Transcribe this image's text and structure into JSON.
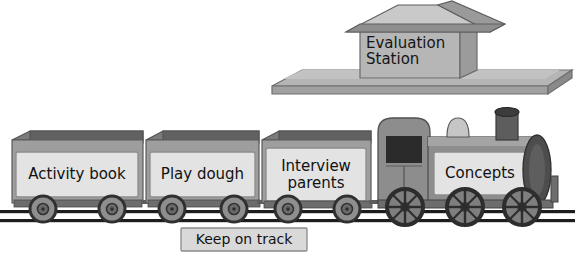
{
  "diagram": {
    "background": "#ffffff"
  },
  "station": {
    "name": "evaluation-station",
    "label": "Evaluation\nStation",
    "roof_light": "#c8c8c8",
    "roof_dark": "#8f8f8f",
    "wall": "#b5b5b5",
    "wall_side": "#9a9a9a",
    "platform_top": "#b0b0b0",
    "platform_edge": "#7d7d7d"
  },
  "locomotive": {
    "name": "locomotive",
    "label": "Concepts",
    "body": "#8d8d8d",
    "body_dark": "#6f6f6f",
    "panel": "#dedede",
    "window": "#2b2b2b",
    "chimney": "#5a5a5a",
    "chimney_cap": "#3c3c3c",
    "dome": "#c4c4c4",
    "smokebox": "#4a4a4a",
    "wheel": "#6a6a6a",
    "wheel_rim": "#2f2f2f",
    "wheel_count": 3
  },
  "wagons": [
    {
      "name": "wagon-activity-book",
      "label": "Activity book",
      "x": 10,
      "width": 130,
      "wheels": 2
    },
    {
      "name": "wagon-play-dough",
      "label": "Play dough",
      "x": 140,
      "width": 118,
      "wheels": 2
    },
    {
      "name": "wagon-interview-parents",
      "label": "Interview\nparents",
      "x": 258,
      "width": 112,
      "wheels": 2
    }
  ],
  "wagon_style": {
    "rim": "#7b7b7b",
    "inner": "#5f5f5f",
    "body": "#9d9d9d",
    "panel": "#e2e2e2",
    "panel_border": "#8a8a8a",
    "wheel": "#8b8b8b",
    "wheel_rim": "#3a3a3a",
    "hub": "#4a4a4a"
  },
  "track": {
    "name": "railway-track",
    "label": "Keep on track",
    "rail_color": "#1d1d1d",
    "sign_fill": "#d9d9d9",
    "sign_border": "#8a8a8a"
  }
}
